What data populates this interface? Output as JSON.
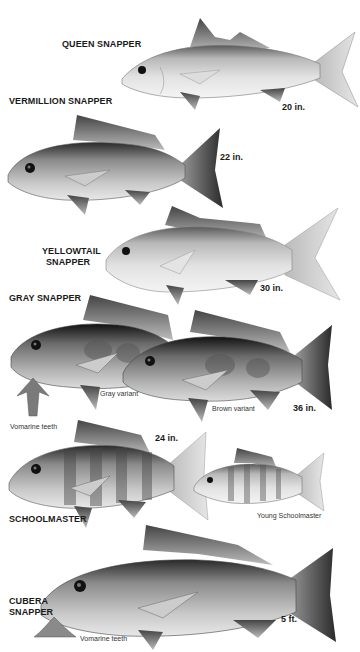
{
  "species": [
    {
      "name": "QUEEN SNAPPER",
      "size": "20 in."
    },
    {
      "name": "VERMILLION SNAPPER",
      "size": "22 in."
    },
    {
      "name_line1": "YELLOWTAIL",
      "name_line2": "SNAPPER",
      "size": "30 in."
    },
    {
      "name": "GRAY SNAPPER",
      "size": "36 in.",
      "variant_a": "Gray variant",
      "variant_b": "Brown variant",
      "teeth": "Vomarine teeth"
    },
    {
      "name": "SCHOOLMASTER",
      "size": "24 in.",
      "young": "Young Schoolmaster"
    },
    {
      "name_line1": "CUBERA",
      "name_line2": "SNAPPER",
      "size": "5 ft.",
      "teeth": "Vomarine teeth"
    }
  ]
}
